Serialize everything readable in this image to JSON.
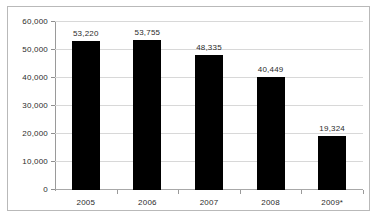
{
  "chart_data": {
    "type": "bar",
    "title": "",
    "subtitle": "",
    "xlabel": "",
    "ylabel": "",
    "categories": [
      "2005",
      "2006",
      "2007",
      "2008",
      "2009*"
    ],
    "values": [
      53220,
      53755,
      48335,
      40449,
      19324
    ],
    "value_labels": [
      "53,220",
      "53,755",
      "48,335",
      "40,449",
      "19,324"
    ],
    "series": [
      {
        "name": "",
        "values": [
          53220,
          53755,
          48335,
          40449,
          19324
        ]
      }
    ],
    "ylim": [
      0,
      60000
    ],
    "ytick_step": 10000,
    "ytick_labels": [
      "0",
      "10,000",
      "20,000",
      "30,000",
      "40,000",
      "50,000",
      "60,000"
    ],
    "ytick_values": [
      0,
      10000,
      20000,
      30000,
      40000,
      50000,
      60000
    ],
    "grid": true,
    "legend": false,
    "legend_position": "none",
    "bar_color": "#000000",
    "gridline_color": "#d8d8d8",
    "axis_color": "#9a9a9a",
    "frame_color": "#b9b9b9",
    "text_color": "#2b2b2b",
    "annotations": [
      "2009*"
    ]
  }
}
